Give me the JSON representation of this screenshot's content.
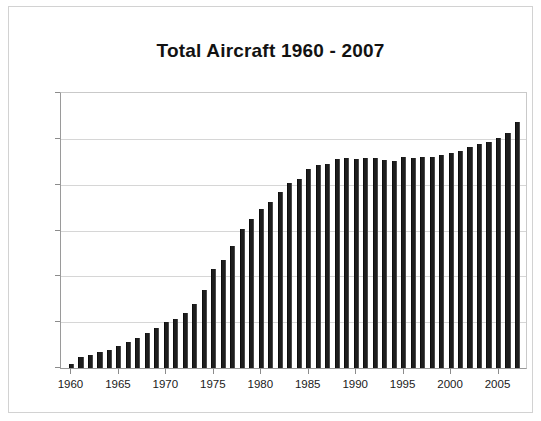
{
  "chart_data": {
    "type": "bar",
    "title": "Total Aircraft 1960 - 2007",
    "xlabel": "",
    "ylabel": "",
    "ylim": [
      5000,
      35000
    ],
    "ytick_labels": [
      "35000",
      "30000",
      "25000",
      "20000",
      "15000",
      "10000",
      "5000"
    ],
    "ytick_values": [
      35000,
      30000,
      25000,
      20000,
      15000,
      10000,
      5000
    ],
    "xtick_labels": [
      "1960",
      "1965",
      "1970",
      "1975",
      "1980",
      "1985",
      "1990",
      "1995",
      "2000",
      "2005"
    ],
    "xtick_values": [
      1960,
      1965,
      1970,
      1975,
      1980,
      1985,
      1990,
      1995,
      2000,
      2005
    ],
    "grid": true,
    "legend": null,
    "bar_color": "#1d1d1d",
    "categories": [
      1960,
      1961,
      1962,
      1963,
      1964,
      1965,
      1966,
      1967,
      1968,
      1969,
      1970,
      1971,
      1972,
      1973,
      1974,
      1975,
      1976,
      1977,
      1978,
      1979,
      1980,
      1981,
      1982,
      1983,
      1984,
      1985,
      1986,
      1987,
      1988,
      1989,
      1990,
      1991,
      1992,
      1993,
      1994,
      1995,
      1996,
      1997,
      1998,
      1999,
      2000,
      2001,
      2002,
      2003,
      2004,
      2005,
      2006,
      2007
    ],
    "values": [
      5400,
      6200,
      6400,
      6700,
      7000,
      7400,
      7800,
      8300,
      8800,
      9400,
      10000,
      10300,
      11000,
      12000,
      13500,
      15800,
      16800,
      18300,
      20200,
      21300,
      22300,
      23100,
      24200,
      25200,
      25600,
      26700,
      27100,
      27300,
      27800,
      27900,
      27800,
      27900,
      27900,
      27700,
      27600,
      28000,
      27900,
      28000,
      28000,
      28200,
      28500,
      28700,
      29100,
      29400,
      29700,
      30100,
      30600,
      31800
    ]
  }
}
